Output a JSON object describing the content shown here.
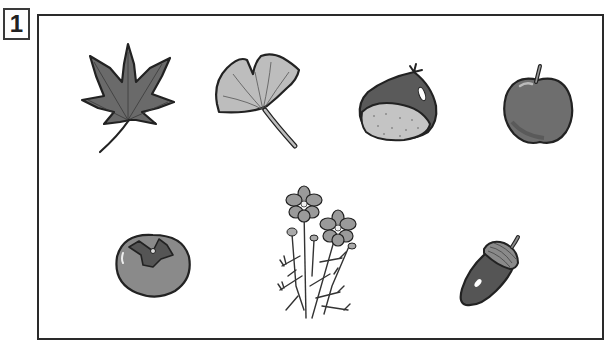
{
  "question": {
    "number": "1"
  },
  "illustrations": [
    {
      "name": "maple-leaf",
      "label": "maple leaf",
      "fill": "#6a6a6a"
    },
    {
      "name": "ginkgo-leaf",
      "label": "ginkgo leaf",
      "fill": "#bdbdbd"
    },
    {
      "name": "chestnut",
      "label": "chestnut",
      "fill": "#5a5a5a"
    },
    {
      "name": "apple",
      "label": "apple",
      "fill": "#6e6e6e"
    },
    {
      "name": "persimmon",
      "label": "persimmon",
      "fill": "#8a8a8a"
    },
    {
      "name": "cosmos-flower",
      "label": "cosmos flowers",
      "fill": "#9a9a9a"
    },
    {
      "name": "acorn",
      "label": "acorn",
      "fill": "#555555"
    }
  ],
  "colors": {
    "outline": "#222222",
    "frame": "#2a2a2a",
    "background": "#ffffff"
  }
}
